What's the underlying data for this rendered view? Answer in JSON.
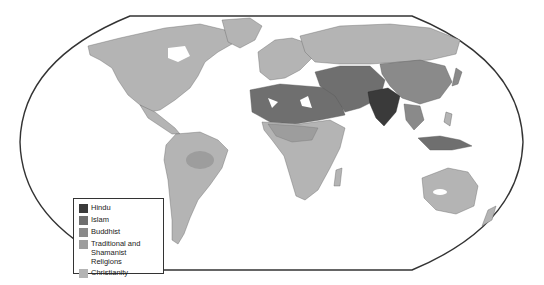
{
  "map": {
    "subject": "World religions",
    "projection": "Robinson-style rounded world outline",
    "background_color": "#ffffff",
    "ocean_color": "#ffffff",
    "outline_color": "#333333",
    "regions": [
      {
        "name": "North America",
        "religion": "Christianity"
      },
      {
        "name": "Central America",
        "religion": "Christianity"
      },
      {
        "name": "South America",
        "religion": "Christianity"
      },
      {
        "name": "Amazon interior",
        "religion": "Traditional and Shamanist Religions"
      },
      {
        "name": "Europe",
        "religion": "Christianity"
      },
      {
        "name": "Russia",
        "religion": "Christianity"
      },
      {
        "name": "North Africa",
        "religion": "Islam"
      },
      {
        "name": "Middle East",
        "religion": "Islam"
      },
      {
        "name": "Central Asia",
        "religion": "Islam"
      },
      {
        "name": "India",
        "religion": "Hindu"
      },
      {
        "name": "China",
        "religion": "Buddhist"
      },
      {
        "name": "Mongolia",
        "religion": "Buddhist"
      },
      {
        "name": "Southeast Asia",
        "religion": "Buddhist"
      },
      {
        "name": "Indonesia",
        "religion": "Islam"
      },
      {
        "name": "Sub-Saharan Africa",
        "religion": "Christianity"
      },
      {
        "name": "West/Central Africa",
        "religion": "Traditional and Shamanist Religions"
      },
      {
        "name": "Australia",
        "religion": "Christianity"
      },
      {
        "name": "New Zealand",
        "religion": "Christianity"
      },
      {
        "name": "Philippines",
        "religion": "Christianity"
      }
    ]
  },
  "legend": {
    "items": [
      {
        "label": "Hindu",
        "color": "#3a3a3a"
      },
      {
        "label": "Islam",
        "color": "#6f6f6f"
      },
      {
        "label": "Buddhist",
        "color": "#8a8a8a"
      },
      {
        "label": "Traditional and Shamanist Religions",
        "color": "#9d9d9d"
      },
      {
        "label": "Christianity",
        "color": "#b4b4b4"
      }
    ]
  }
}
